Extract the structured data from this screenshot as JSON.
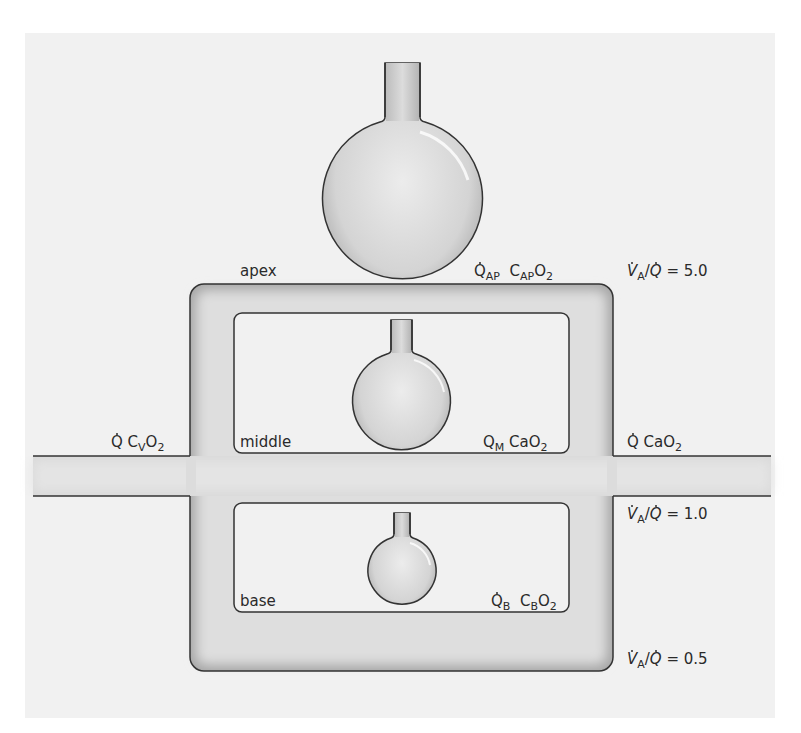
{
  "diagram": {
    "type": "lung-zone ventilation/perfusion model",
    "colors": {
      "page": "#ffffff",
      "panel": "#f1f1f1",
      "tube_fill": "#dcdcdc",
      "tube_shadow": "#9a9a9a",
      "outline": "#333333",
      "flask_fill": "#cfcfcf"
    },
    "regions": [
      {
        "id": "apex",
        "label": "apex",
        "flow": "Q",
        "flow_sub": "AP",
        "content": "C",
        "content_sub": "AP",
        "content_suffix": "O",
        "content_suffix_sub": "2"
      },
      {
        "id": "middle",
        "label": "middle",
        "flow": "Q",
        "flow_sub": "M",
        "content": "CaO",
        "content_sub": "",
        "content_suffix": "",
        "content_suffix_sub": "2"
      },
      {
        "id": "base",
        "label": "base",
        "flow": "Q",
        "flow_sub": "B",
        "content": "C",
        "content_sub": "B",
        "content_suffix": "O",
        "content_suffix_sub": "2"
      }
    ],
    "inflow": {
      "flow": "Q",
      "content": "C",
      "content_sub": "V",
      "content_suffix": "O",
      "content_suffix_sub": "2"
    },
    "outflow": {
      "flow": "Q",
      "content": "CaO",
      "content_sub": "2"
    },
    "ratios": [
      {
        "lhs_num": "V",
        "lhs_num_sub": "A",
        "lhs_den": "Q",
        "eq": "= 5.0"
      },
      {
        "lhs_num": "V",
        "lhs_num_sub": "A",
        "lhs_den": "Q",
        "eq": "= 1.0"
      },
      {
        "lhs_num": "V",
        "lhs_num_sub": "A",
        "lhs_den": "Q",
        "eq": "= 0.5"
      }
    ]
  }
}
